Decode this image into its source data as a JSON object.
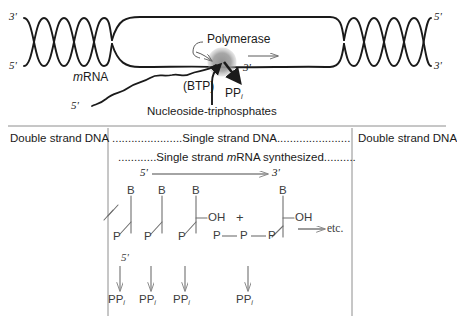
{
  "figure": {
    "title_hidden": "Transcription: mRNA synthesis by polymerase on a DNA template"
  },
  "colors": {
    "ink": "#1a1a1a",
    "line": "#2b2b2b",
    "polymerase_fill": "#9a9a9a",
    "faint_line": "#9b9b9b",
    "divider": "#8e8e8e"
  },
  "top_panel": {
    "labels": {
      "left_top_end": "3'",
      "left_bottom_end": "5'",
      "right_top_end": "5'",
      "right_bottom_end": "3'",
      "polymerase": "Polymerase",
      "mrna": "mRNA",
      "mrna_italic_prefix": "m",
      "mrna_rest": "RNA",
      "mrna_five_prime": "5'",
      "growing_three_prime": "3'",
      "btp": "(BTP)",
      "ppi": "PP",
      "ppi_subscript": "i",
      "substrate": "Nucleoside-triphosphates"
    }
  },
  "bottom_panel": {
    "region_left": "Double strand DNA",
    "region_right": "Double strand DNA",
    "row_single_dna": {
      "dots_left": "......................",
      "text": "Single strand DNA",
      "dots_right": "......................."
    },
    "row_single_mrna": {
      "dots_left": "............",
      "text_italic_prefix": "m",
      "text_before": "Single strand ",
      "text_after": "RNA synthesized",
      "full_text": "Single strand mRNA synthesized",
      "dots_right": ".........."
    },
    "direction": {
      "five_prime": "5'",
      "three_prime": "3'"
    },
    "bases": [
      "B",
      "B",
      "B",
      "B"
    ],
    "phosphates_backbone": [
      "P",
      "P",
      "P"
    ],
    "triphosphate_chain": [
      "P",
      "P",
      "P"
    ],
    "hydroxyls": [
      "OH",
      "OH"
    ],
    "plus_sign": "+",
    "etc_label": "etc.",
    "chain_five_prime": "5'",
    "pyrophosphates": [
      {
        "label": "PP",
        "sub": "i"
      },
      {
        "label": "PP",
        "sub": "i"
      },
      {
        "label": "PP",
        "sub": "i"
      },
      {
        "label": "PP",
        "sub": "i"
      }
    ]
  }
}
